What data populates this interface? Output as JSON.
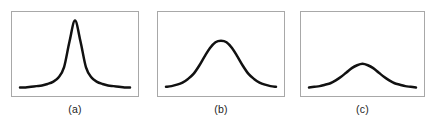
{
  "figure": {
    "width": 437,
    "height": 122,
    "background_color": "#ffffff",
    "frame_color": "#a8a8a8",
    "curve_color": "#111111",
    "curve_width": 2.5,
    "label_color": "#1c1c1c"
  },
  "panels": [
    {
      "id": "a",
      "label": "(a)"
    },
    {
      "id": "b",
      "label": "(b)"
    },
    {
      "id": "c",
      "label": "(c)"
    }
  ],
  "chart_data": [
    {
      "type": "line",
      "title": "(a)",
      "xlabel": "",
      "ylabel": "",
      "grid": false,
      "legend": "none",
      "xlim": [
        -4,
        4
      ],
      "ylim": [
        0,
        1
      ],
      "description": "Tall narrow sharply peaked bell curve with long low tails (leptokurtic)",
      "x": [
        -4,
        -3.6,
        -3.2,
        -2.8,
        -2.4,
        -2,
        -1.6,
        -1.2,
        -0.8,
        -0.4,
        0,
        0.4,
        0.8,
        1.2,
        1.6,
        2,
        2.4,
        2.8,
        3.2,
        3.6,
        4
      ],
      "values": [
        0.02,
        0.02,
        0.03,
        0.04,
        0.05,
        0.07,
        0.1,
        0.16,
        0.3,
        0.66,
        0.95,
        0.66,
        0.3,
        0.16,
        0.1,
        0.07,
        0.05,
        0.04,
        0.03,
        0.02,
        0.02
      ],
      "peak_height": 0.95
    },
    {
      "type": "line",
      "title": "(b)",
      "xlabel": "",
      "ylabel": "",
      "grid": false,
      "legend": "none",
      "xlim": [
        -4,
        4
      ],
      "ylim": [
        0,
        1
      ],
      "description": "Medium height broad rounded bell curve (mesokurtic)",
      "x": [
        -4,
        -3.6,
        -3.2,
        -2.8,
        -2.4,
        -2,
        -1.6,
        -1.2,
        -0.8,
        -0.4,
        0,
        0.4,
        0.8,
        1.2,
        1.6,
        2,
        2.4,
        2.8,
        3.2,
        3.6,
        4
      ],
      "values": [
        0.03,
        0.04,
        0.06,
        0.09,
        0.14,
        0.21,
        0.32,
        0.45,
        0.57,
        0.65,
        0.67,
        0.65,
        0.57,
        0.45,
        0.32,
        0.21,
        0.14,
        0.09,
        0.06,
        0.04,
        0.03
      ],
      "peak_height": 0.67
    },
    {
      "type": "line",
      "title": "(c)",
      "xlabel": "",
      "ylabel": "",
      "grid": false,
      "legend": "none",
      "xlim": [
        -4,
        4
      ],
      "ylim": [
        0,
        1
      ],
      "description": "Low flat wide bell curve (platykurtic)",
      "x": [
        -4,
        -3.6,
        -3.2,
        -2.8,
        -2.4,
        -2,
        -1.6,
        -1.2,
        -0.8,
        -0.4,
        0,
        0.4,
        0.8,
        1.2,
        1.6,
        2,
        2.4,
        2.8,
        3.2,
        3.6,
        4
      ],
      "values": [
        0.02,
        0.03,
        0.04,
        0.06,
        0.08,
        0.12,
        0.17,
        0.23,
        0.29,
        0.33,
        0.35,
        0.33,
        0.29,
        0.23,
        0.17,
        0.12,
        0.08,
        0.06,
        0.04,
        0.03,
        0.02
      ],
      "peak_height": 0.35
    }
  ]
}
